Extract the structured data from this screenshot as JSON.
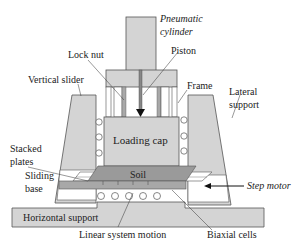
{
  "diagram": {
    "type": "mechanical schematic",
    "colors": {
      "part_fill": "#d4d4d4",
      "dark_fill": "#a8a8a8",
      "soil_fill": "#9a9a9a",
      "outline": "#555555",
      "background": "#ffffff"
    },
    "labels": {
      "pneumatic_cylinder_line1": "Pneumatic",
      "pneumatic_cylinder_line2": "cylinder",
      "lock_nut": "Lock nut",
      "piston": "Piston",
      "vertical_slider": "Vertical slider",
      "frame": "Frame",
      "lateral_support_line1": "Lateral",
      "lateral_support_line2": "support",
      "loading_cap": "Loading cap",
      "stacked_plates_line1": "Stacked",
      "stacked_plates_line2": "plates",
      "sliding_base_line1": "Sliding",
      "sliding_base_line2": "base",
      "soil": "Soil",
      "step_motor": "Step motor",
      "horizontal_support": "Horizontal support",
      "linear_system_motion": "Linear system motion",
      "biaxial_cells": "Biaxial cells"
    }
  }
}
